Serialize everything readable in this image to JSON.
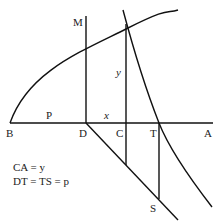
{
  "diagram": {
    "points": {
      "M": "M",
      "B": "B",
      "D": "D",
      "C": "C",
      "T": "T",
      "A": "A",
      "S": "S"
    },
    "segment_labels": {
      "p": "P",
      "x": "x",
      "y": "y"
    },
    "equations": [
      "CA = y",
      "DT = TS = p"
    ]
  }
}
